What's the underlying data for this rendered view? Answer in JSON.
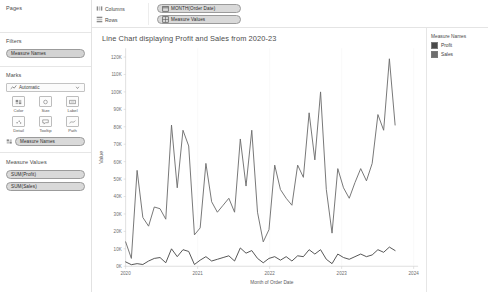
{
  "sidebar": {
    "pages": {
      "title": "Pages"
    },
    "filters": {
      "title": "Filters",
      "pills": [
        {
          "label": "Measure Names"
        }
      ]
    },
    "marks": {
      "title": "Marks",
      "type_selected": "Automatic",
      "buttons": [
        {
          "label": "Color",
          "icon": "color-icon"
        },
        {
          "label": "Size",
          "icon": "size-icon"
        },
        {
          "label": "Label",
          "icon": "label-icon"
        },
        {
          "label": "Detail",
          "icon": "detail-icon"
        },
        {
          "label": "Tooltip",
          "icon": "tooltip-icon"
        },
        {
          "label": "Path",
          "icon": "path-icon"
        }
      ],
      "pills": [
        {
          "label": "Measure Names",
          "icon": "color-icon"
        }
      ]
    },
    "measure_values": {
      "title": "Measure Values",
      "pills": [
        {
          "label": "SUM(Profit)"
        },
        {
          "label": "SUM(Sales)"
        }
      ]
    }
  },
  "shelves": [
    {
      "name": "Columns",
      "pill": "MONTH(Order Date)",
      "pill_icon": "calendar-icon"
    },
    {
      "name": "Rows",
      "pill": "Measure Values",
      "pill_icon": "grid-icon"
    }
  ],
  "legend": {
    "title": "Measure Names",
    "items": [
      {
        "label": "Profit",
        "color": "#4a4a4a"
      },
      {
        "label": "Sales",
        "color": "#6e6e6e"
      }
    ]
  },
  "chart_data": {
    "type": "line",
    "title": "Line Chart displaying Profit and Sales from 2020-23",
    "xlabel": "Month of Order Date",
    "ylabel": "Value",
    "ylim": [
      0,
      125000
    ],
    "yticks": [
      0,
      10000,
      20000,
      30000,
      40000,
      50000,
      60000,
      70000,
      80000,
      90000,
      100000,
      110000,
      120000
    ],
    "ytick_labels": [
      "0K",
      "10K",
      "20K",
      "30K",
      "40K",
      "50K",
      "60K",
      "70K",
      "80K",
      "90K",
      "100K",
      "110K",
      "120K"
    ],
    "xlim": [
      "2020-01",
      "2023-12"
    ],
    "xticks": [
      "2020",
      "2021",
      "2022",
      "2023",
      "2024"
    ],
    "grid": false,
    "legend_position": "right",
    "x": [
      "2020-01",
      "2020-02",
      "2020-03",
      "2020-04",
      "2020-05",
      "2020-06",
      "2020-07",
      "2020-08",
      "2020-09",
      "2020-10",
      "2020-11",
      "2020-12",
      "2021-01",
      "2021-02",
      "2021-03",
      "2021-04",
      "2021-05",
      "2021-06",
      "2021-07",
      "2021-08",
      "2021-09",
      "2021-10",
      "2021-11",
      "2021-12",
      "2022-01",
      "2022-02",
      "2022-03",
      "2022-04",
      "2022-05",
      "2022-06",
      "2022-07",
      "2022-08",
      "2022-09",
      "2022-10",
      "2022-11",
      "2022-12",
      "2023-01",
      "2023-02",
      "2023-03",
      "2023-04",
      "2023-05",
      "2023-06",
      "2023-07",
      "2023-08",
      "2023-09",
      "2023-10",
      "2023-11",
      "2023-12"
    ],
    "series": [
      {
        "name": "Sales",
        "color": "#6e6e6e",
        "values": [
          14000,
          4500,
          55000,
          28000,
          23000,
          34000,
          33000,
          27000,
          81000,
          45000,
          78000,
          69000,
          18000,
          22000,
          59000,
          37000,
          31000,
          35000,
          39000,
          31000,
          73000,
          46000,
          78000,
          31000,
          14000,
          21000,
          58000,
          44000,
          39000,
          35000,
          58000,
          51000,
          88000,
          61000,
          100000,
          44000,
          19000,
          56000,
          45000,
          39000,
          48000,
          56000,
          49000,
          59000,
          87000,
          78000,
          119000,
          81000
        ]
      },
      {
        "name": "Profit",
        "color": "#4a4a4a",
        "values": [
          2500,
          900,
          1500,
          1000,
          3000,
          4500,
          5000,
          2000,
          10000,
          5500,
          9500,
          8500,
          1000,
          3500,
          5500,
          3000,
          4000,
          5000,
          6000,
          3000,
          10500,
          7500,
          9000,
          4500,
          2000,
          4500,
          5500,
          3500,
          5500,
          3000,
          6000,
          5500,
          9500,
          7000,
          9500,
          4000,
          1500,
          7000,
          5000,
          4000,
          5500,
          7000,
          5500,
          6500,
          9500,
          8000,
          11000,
          9000
        ]
      }
    ]
  }
}
